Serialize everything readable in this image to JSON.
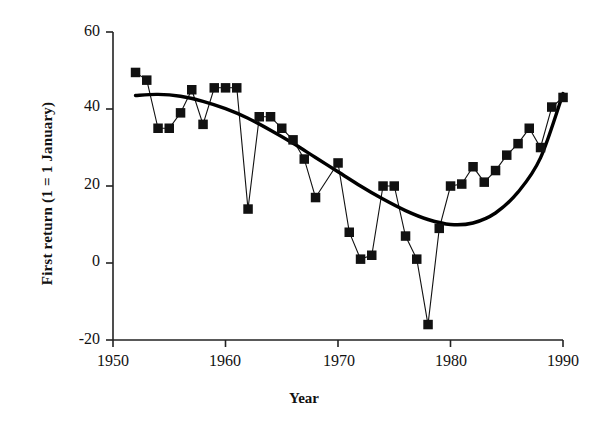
{
  "chart_data": {
    "type": "scatter",
    "title": "",
    "xlabel": "Year",
    "ylabel": "First return (1 = 1 January)",
    "xlim": [
      1950,
      1990
    ],
    "ylim": [
      -20,
      60
    ],
    "xticks": [
      1950,
      1960,
      1970,
      1980,
      1990
    ],
    "yticks": [
      -20,
      0,
      20,
      40,
      60
    ],
    "grid": false,
    "legend": null,
    "marker": "filled-square",
    "marker_color": "#111111",
    "line_color": "#111111",
    "trend_color": "#000000",
    "series": [
      {
        "name": "First return date",
        "style": "markers-with-thin-connecting-line",
        "x": [
          1952,
          1953,
          1954,
          1955,
          1956,
          1957,
          1958,
          1959,
          1960,
          1961,
          1962,
          1963,
          1964,
          1965,
          1966,
          1967,
          1968,
          1970,
          1971,
          1972,
          1973,
          1974,
          1975,
          1976,
          1977,
          1978,
          1979,
          1980,
          1981,
          1982,
          1983,
          1984,
          1985,
          1986,
          1987,
          1988,
          1989,
          1990
        ],
        "values": [
          49.5,
          47.5,
          35.0,
          35.0,
          39.0,
          45.0,
          36.0,
          45.5,
          45.5,
          45.5,
          14.0,
          38.0,
          38.0,
          35.0,
          32.0,
          27.0,
          17.0,
          26.0,
          8.0,
          1.0,
          2.0,
          20.0,
          20.0,
          7.0,
          1.0,
          -16.0,
          9.0,
          20.0,
          20.5,
          25.0,
          21.0,
          24.0,
          28.0,
          31.0,
          35.0,
          30.0,
          40.5,
          43.0
        ]
      },
      {
        "name": "Fitted polynomial trend",
        "style": "thick-smooth-curve",
        "x": [
          1952,
          1954,
          1956,
          1958,
          1960,
          1962,
          1964,
          1966,
          1968,
          1970,
          1972,
          1974,
          1976,
          1978,
          1980,
          1982,
          1984,
          1986,
          1988,
          1990
        ],
        "values": [
          43.5,
          43.8,
          43.3,
          42.0,
          40.1,
          37.6,
          34.5,
          31.1,
          27.4,
          23.7,
          20.0,
          16.6,
          13.6,
          11.3,
          10.0,
          10.4,
          13.0,
          18.4,
          27.3,
          44.0
        ]
      }
    ]
  },
  "axes": {
    "x_tick_labels": [
      "1950",
      "1960",
      "1970",
      "1980",
      "1990"
    ],
    "y_tick_labels": [
      "60",
      "40",
      "20",
      "0",
      "-20"
    ],
    "x_axis_title": "Year",
    "y_axis_title": "First return (1 = 1 January)"
  }
}
